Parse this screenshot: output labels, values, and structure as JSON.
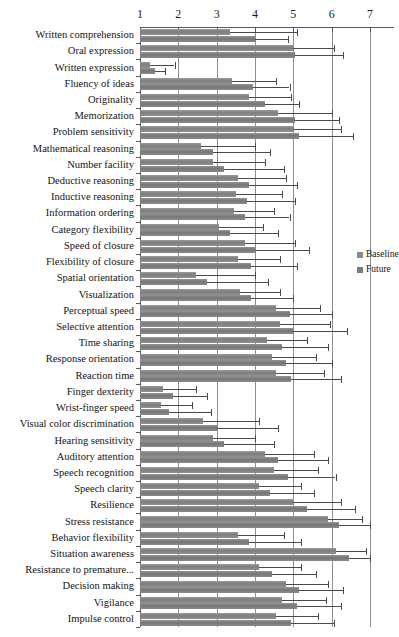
{
  "chart_data": {
    "type": "bar",
    "orientation": "horizontal",
    "title": "",
    "xlabel": "",
    "ylabel": "",
    "xlim": [
      1,
      7
    ],
    "xticks": [
      1,
      2,
      3,
      4,
      5,
      6,
      7
    ],
    "grid": true,
    "legend_position": "right",
    "legend": [
      "Baseline",
      "Future"
    ],
    "error_bars": true,
    "categories": [
      "Written comprehension",
      "Oral expression",
      "Written expression",
      "Fluency of ideas",
      "Originality",
      "Memorization",
      "Problem sensitivity",
      "Mathematical reasoning",
      "Number facility",
      "Deductive reasoning",
      "Inductive reasoning",
      "Information ordering",
      "Category flexibility",
      "Speed of closure",
      "Flexibility of closure",
      "Spatial orientation",
      "Visualization",
      "Perceptual speed",
      "Selective attention",
      "Time sharing",
      "Response orientation",
      "Reaction time",
      "Finger dexterity",
      "Wrist-finger speed",
      "Visual color discrimination",
      "Hearing sensitivity",
      "Auditory attention",
      "Speech recognition",
      "Speech clarity",
      "Resilience",
      "Stress resistance",
      "Behavior flexibility",
      "Situation awareness",
      "Resistance to premature...",
      "Decision making",
      "Vigilance",
      "Impulse control"
    ],
    "series": [
      {
        "name": "Baseline",
        "values": [
          3.35,
          5.0,
          1.25,
          3.4,
          3.85,
          4.6,
          5.0,
          2.6,
          2.9,
          3.55,
          3.5,
          3.45,
          3.05,
          3.75,
          3.55,
          2.45,
          3.6,
          4.55,
          4.65,
          4.3,
          4.45,
          4.55,
          1.6,
          1.55,
          2.65,
          2.9,
          4.25,
          4.5,
          4.1,
          5.0,
          5.9,
          3.55,
          6.1,
          4.1,
          4.8,
          4.7,
          4.55
        ],
        "err_low": [
          3.35,
          5.0,
          1.25,
          3.4,
          3.85,
          4.6,
          5.0,
          2.6,
          2.9,
          3.55,
          3.5,
          3.45,
          3.05,
          3.75,
          3.55,
          2.45,
          3.6,
          4.55,
          4.65,
          4.3,
          4.45,
          4.55,
          1.6,
          1.55,
          2.65,
          2.9,
          4.25,
          4.5,
          4.1,
          5.0,
          5.9,
          3.55,
          6.1,
          4.1,
          4.8,
          4.7,
          4.55
        ],
        "err_high": [
          5.1,
          6.05,
          1.9,
          4.55,
          4.95,
          6.0,
          6.25,
          4.0,
          4.25,
          4.8,
          4.7,
          4.5,
          4.2,
          5.05,
          4.65,
          4.0,
          4.65,
          5.7,
          5.95,
          5.35,
          5.6,
          5.8,
          2.45,
          2.35,
          4.1,
          4.0,
          5.55,
          5.65,
          5.2,
          6.25,
          6.8,
          4.75,
          6.9,
          5.2,
          5.9,
          5.85,
          5.65
        ]
      },
      {
        "name": "Future",
        "values": [
          4.0,
          5.05,
          1.4,
          3.95,
          4.25,
          5.05,
          5.15,
          2.9,
          3.2,
          3.85,
          3.8,
          3.75,
          3.35,
          4.0,
          3.9,
          2.75,
          3.9,
          4.9,
          5.0,
          4.7,
          4.8,
          4.95,
          1.85,
          1.75,
          3.0,
          3.2,
          4.6,
          4.85,
          4.4,
          5.35,
          6.2,
          3.85,
          6.45,
          4.45,
          5.15,
          5.1,
          4.95
        ],
        "err_low": [
          4.0,
          5.05,
          1.4,
          3.95,
          4.25,
          5.05,
          5.15,
          2.9,
          3.2,
          3.85,
          3.8,
          3.75,
          3.35,
          4.0,
          3.9,
          2.75,
          3.9,
          4.9,
          5.0,
          4.7,
          4.8,
          4.95,
          1.85,
          1.75,
          3.0,
          3.2,
          4.6,
          4.85,
          4.4,
          5.35,
          6.2,
          3.85,
          6.45,
          4.45,
          5.15,
          5.1,
          4.95
        ],
        "err_high": [
          4.85,
          6.3,
          1.65,
          4.9,
          5.15,
          6.2,
          6.55,
          4.4,
          4.75,
          5.1,
          5.05,
          4.9,
          4.6,
          5.4,
          5.1,
          4.35,
          5.0,
          6.0,
          6.4,
          5.9,
          6.0,
          6.25,
          2.75,
          2.85,
          4.6,
          4.5,
          5.9,
          6.1,
          5.55,
          6.6,
          7.0,
          5.2,
          7.0,
          5.6,
          6.3,
          6.25,
          6.05
        ]
      }
    ]
  },
  "legend": {
    "baseline_label": "Baseline",
    "future_label": "Future"
  },
  "colors": {
    "baseline": "#8a8a8a",
    "future": "#7d7d7d",
    "grid": "#8e8e8e",
    "axis": "#5a5a5a",
    "error": "#4a4a4a",
    "text": "#131313",
    "background": "#ffffff"
  }
}
